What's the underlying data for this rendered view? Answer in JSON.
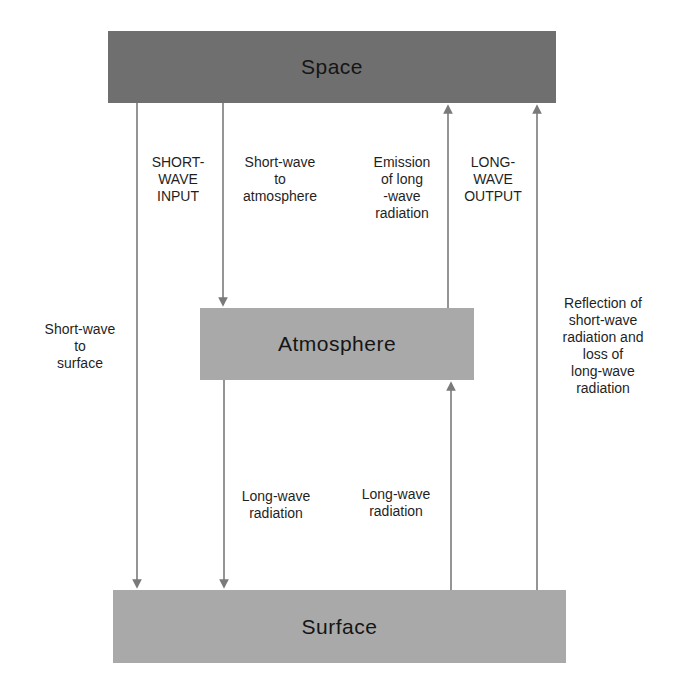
{
  "diagram": {
    "colors": {
      "space_box": "#6f6f6f",
      "layer_box": "#a9a9a9",
      "arrow": "#7a7a7a",
      "text": "#1f1f1f"
    },
    "nodes": {
      "space": {
        "label": "Space"
      },
      "atmosphere": {
        "label": "Atmosphere"
      },
      "surface": {
        "label": "Surface"
      }
    },
    "flows": [
      {
        "id": "shortwave-to-surface",
        "from": "space",
        "to": "surface",
        "direction": "down",
        "label_lines": [
          "Short-wave",
          "to",
          "surface"
        ]
      },
      {
        "id": "shortwave-input",
        "from": "space",
        "to": "system",
        "direction": "down",
        "label_lines": [
          "SHORT-",
          "WAVE",
          "INPUT"
        ]
      },
      {
        "id": "shortwave-to-atmosphere",
        "from": "space",
        "to": "atmosphere",
        "direction": "down",
        "label_lines": [
          "Short-wave",
          "to",
          "atmosphere"
        ]
      },
      {
        "id": "emission-longwave",
        "from": "atmosphere",
        "to": "space",
        "direction": "up",
        "label_lines": [
          "Emission",
          "of long",
          "-wave",
          "radiation"
        ]
      },
      {
        "id": "longwave-output",
        "from": "system",
        "to": "space",
        "direction": "up",
        "label_lines": [
          "LONG-",
          "WAVE",
          "OUTPUT"
        ]
      },
      {
        "id": "reflection-loss",
        "from": "surface",
        "to": "space",
        "direction": "up",
        "label_lines": [
          "Reflection of",
          "short-wave",
          "radiation and",
          "loss of",
          "long-wave",
          "radiation"
        ]
      },
      {
        "id": "longwave-atm-to-surface",
        "from": "atmosphere",
        "to": "surface",
        "direction": "down",
        "label_lines": [
          "Long-wave",
          "radiation"
        ]
      },
      {
        "id": "longwave-surface-to-atm",
        "from": "surface",
        "to": "atmosphere",
        "direction": "up",
        "label_lines": [
          "Long-wave",
          "radiation"
        ]
      }
    ]
  }
}
